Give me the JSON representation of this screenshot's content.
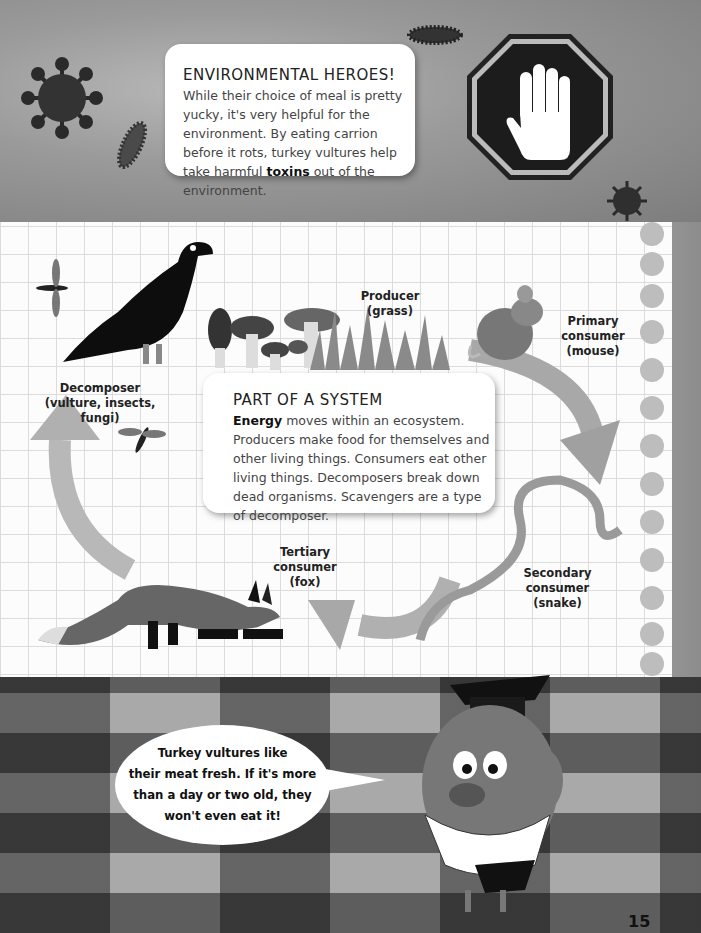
{
  "page": {
    "number": "15"
  },
  "environmental_heroes": {
    "title": "ENVIRONMENTAL HEROES!",
    "body_before": "While their choice of meal is pretty yucky, it's very helpful for the environment. By eating carrion before it rots, turkey vultures help take harmful ",
    "body_bold": "toxins",
    "body_after": " out of the environment."
  },
  "part_of_system": {
    "title": "PART OF A SYSTEM",
    "body_bold": "Energy",
    "body_after": " moves within an ecosystem. Producers make food for themselves and other living things. Consumers eat other living things. Decomposers break down dead organisms. Scavengers are a type of decomposer."
  },
  "food_chain": {
    "producer": {
      "line1": "Producer",
      "line2": "(grass)"
    },
    "primary": {
      "line1": "Primary",
      "line2": "consumer",
      "line3": "(mouse)"
    },
    "secondary": {
      "line1": "Secondary",
      "line2": "consumer",
      "line3": "(snake)"
    },
    "tertiary": {
      "line1": "Tertiary",
      "line2": "consumer",
      "line3": "(fox)"
    },
    "decomposer": {
      "line1": "Decomposer",
      "line2": "(vulture, insects,",
      "line3": "fungi)"
    }
  },
  "speech_bubble": {
    "line1": "Turkey vultures like",
    "line2": "their meat fresh. If it's more",
    "line3": "than a day or two old, they",
    "line4": "won't even eat it!"
  },
  "icons": {
    "stop_sign": "stop-hand-icon",
    "virus": "virus-icon",
    "bacteria": "bacteria-icon"
  }
}
